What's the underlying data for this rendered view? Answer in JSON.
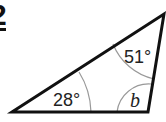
{
  "question": {
    "number": "2"
  },
  "diagram": {
    "type": "triangle",
    "angles": [
      {
        "vertex": "bottom-left",
        "label": "28°"
      },
      {
        "vertex": "top-right",
        "label": "51°"
      },
      {
        "vertex": "bottom-right",
        "label": "b"
      }
    ],
    "colors": {
      "stroke": "#111111",
      "arc": "#999999"
    }
  }
}
